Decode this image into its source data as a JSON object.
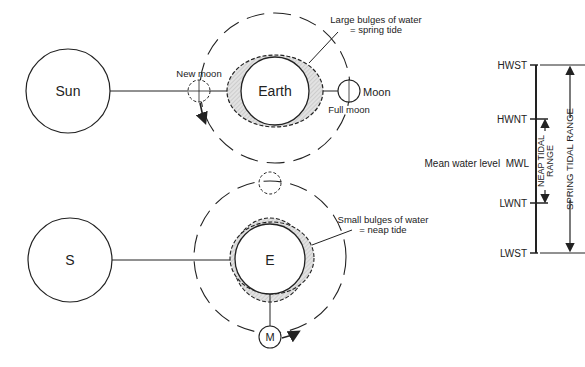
{
  "spring_tide": {
    "sun_label": "Sun",
    "earth_label": "Earth",
    "moon_label": "Moon",
    "new_moon_label": "New moon",
    "full_moon_label": "Full moon",
    "callout_line1": "Large bulges of water",
    "callout_line2": "= spring tide"
  },
  "neap_tide": {
    "sun_label": "S",
    "earth_label": "E",
    "moon_label": "M",
    "callout_line1": "Small bulges of water",
    "callout_line2": "= neap tide"
  },
  "tidal_levels": {
    "hwst": "HWST",
    "hwnt": "HWNT",
    "mwl": "Mean water level  MWL",
    "lwnt": "LWNT",
    "lwst": "LWST",
    "neap_range_line1": "NEAP TIDAL",
    "neap_range_line2": "RANGE",
    "spring_range": "SPRING TIDAL RANGE"
  },
  "colors": {
    "line": "#222222",
    "bulge_fill": "#d8d8d8"
  }
}
